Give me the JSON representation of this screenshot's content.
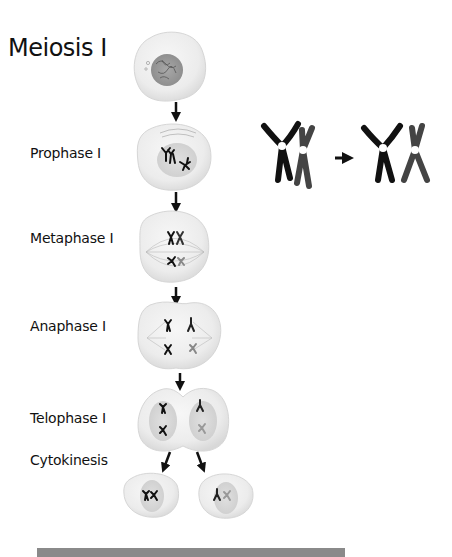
{
  "title": "Meiosis I",
  "stages": [
    {
      "id": "interphase",
      "label": ""
    },
    {
      "id": "prophase-1",
      "label": "Prophase I"
    },
    {
      "id": "metaphase-1",
      "label": "Metaphase I"
    },
    {
      "id": "anaphase-1",
      "label": "Anaphase I"
    },
    {
      "id": "telophase-1",
      "label": "Telophase I"
    },
    {
      "id": "cytokinesis",
      "label": "Cytokinesis"
    }
  ],
  "inset": {
    "description": "crossing over between homologous chromosomes",
    "arrow": "→"
  },
  "colors": {
    "cell_fill": "#ececec",
    "cell_edge": "#d4d4d4",
    "nucleus": "#9a9a9a",
    "chromosome_dark": "#111111",
    "chromosome_gray": "#555555",
    "bottom_bar": "#8a8a8a"
  }
}
